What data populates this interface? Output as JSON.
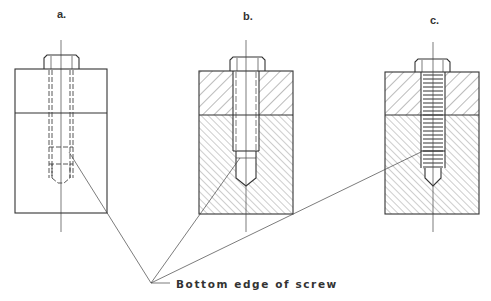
{
  "figure": {
    "panels": [
      {
        "id": "a",
        "label": "a.",
        "view": "hidden-line (dashed)"
      },
      {
        "id": "b",
        "label": "b.",
        "view": "sectioned, plain shank"
      },
      {
        "id": "c",
        "label": "c.",
        "view": "sectioned, threaded shank"
      }
    ],
    "callout": {
      "text": "Bottom edge of screw"
    }
  }
}
